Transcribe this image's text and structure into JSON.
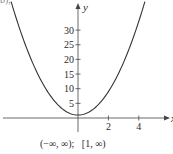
{
  "part_label": "b),",
  "chart_data": {
    "type": "line",
    "title": "",
    "function_approx": "y = 2x^2 + 1",
    "xlabel": "x",
    "ylabel": "y",
    "x_ticks": [
      2,
      4
    ],
    "y_ticks": [
      5,
      10,
      15,
      20,
      25,
      30
    ],
    "xlim": [
      -5,
      5.8
    ],
    "ylim": [
      -5,
      38
    ],
    "grid": false,
    "legend": null,
    "series": [
      {
        "name": "curve",
        "x": [
          -4.4,
          -4,
          -3.5,
          -3,
          -2.5,
          -2,
          -1.5,
          -1,
          -0.5,
          0,
          0.5,
          1,
          1.5,
          2,
          2.5,
          3,
          3.5,
          4,
          4.4
        ],
        "y": [
          39.7,
          33,
          25.5,
          19,
          13.5,
          9,
          5.5,
          3,
          1.5,
          1,
          1.5,
          3,
          5.5,
          9,
          13.5,
          19,
          25.5,
          33,
          39.7
        ]
      }
    ],
    "annotation": "(−∞, ∞);   [1, ∞)",
    "domain": "(−∞, ∞)",
    "range": "[1, ∞)",
    "color": "#333333"
  },
  "layout": {
    "origin_px": [
      78,
      118
    ],
    "px_per_x": 15.2,
    "px_per_y": 2.93,
    "x_axis_px": [
      3,
      165
    ],
    "y_axis_px": [
      132,
      6
    ]
  }
}
